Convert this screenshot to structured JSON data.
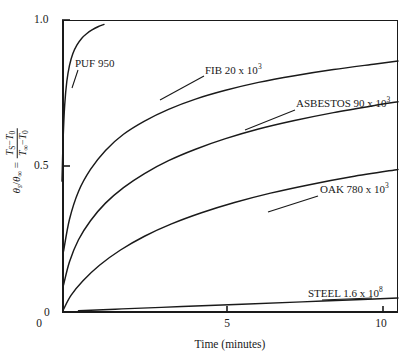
{
  "figure": {
    "title": "",
    "background_color": "#ffffff",
    "line_color": "#1a1a1a"
  },
  "axes": {
    "x": {
      "label": "Time (minutes)",
      "ticks": [
        "0",
        "5",
        "10"
      ],
      "tick_values": [
        0,
        5,
        10
      ],
      "min": 0,
      "max": 11.2
    },
    "y": {
      "label_parts": {
        "symbol": "θ",
        "symbol_sub_s": "s",
        "slash": "/",
        "symbol2": "θ",
        "symbol2_sub": "∞",
        "equals": "=",
        "num_left": "T",
        "num_left_sub": "S",
        "num_minus": "−",
        "num_right": "T",
        "num_right_sub": "0",
        "den_left": "T",
        "den_left_sub": "∞",
        "den_minus": "−",
        "den_right": "T",
        "den_right_sub": "0"
      },
      "ticks": [
        "1.0",
        "0.5",
        "0"
      ],
      "tick_values": [
        1.0,
        0.5,
        0.0
      ],
      "min": 0,
      "max": 1.0
    }
  },
  "chart_data": {
    "type": "line",
    "title": "",
    "xlabel": "Time (minutes)",
    "ylabel": "θs/θ∞ = (TS − T0)/(T∞ − T0)",
    "xlim": [
      0,
      11.2
    ],
    "ylim": [
      0,
      1.0
    ],
    "grid": false,
    "legend": "inline-curve-labels",
    "series": [
      {
        "name": "PUF 950",
        "label": "PUF 950",
        "label_value": "950",
        "x": [
          0.0,
          0.04,
          0.09,
          0.16,
          0.25,
          0.36,
          0.5,
          0.66,
          0.82,
          1.0,
          1.2,
          1.4
        ],
        "y": [
          0.45,
          0.6,
          0.71,
          0.79,
          0.845,
          0.885,
          0.915,
          0.938,
          0.953,
          0.966,
          0.977,
          0.985
        ]
      },
      {
        "name": "FIB 20 x 10^3",
        "label": "FIB 20 x 10",
        "label_exponent": "3",
        "x": [
          0.05,
          0.25,
          0.55,
          0.95,
          1.45,
          2.05,
          2.75,
          3.55,
          4.45,
          5.45,
          6.55,
          7.75,
          9.05,
          10.45,
          11.2
        ],
        "y": [
          0.21,
          0.32,
          0.415,
          0.49,
          0.555,
          0.61,
          0.655,
          0.695,
          0.73,
          0.76,
          0.787,
          0.81,
          0.831,
          0.85,
          0.86
        ]
      },
      {
        "name": "ASBESTOS 90 x 10^3",
        "label": "ASBESTOS 90 x 10",
        "label_exponent": "3",
        "x": [
          0.05,
          0.25,
          0.55,
          0.95,
          1.45,
          2.05,
          2.75,
          3.55,
          4.45,
          5.45,
          6.55,
          7.75,
          9.05,
          10.45,
          11.2
        ],
        "y": [
          0.095,
          0.175,
          0.25,
          0.315,
          0.375,
          0.428,
          0.476,
          0.52,
          0.559,
          0.595,
          0.628,
          0.657,
          0.684,
          0.709,
          0.721
        ]
      },
      {
        "name": "OAK 780 x 10^3",
        "label": "OAK 780 x 10",
        "label_exponent": "3",
        "x": [
          0.05,
          0.3,
          0.7,
          1.25,
          1.95,
          2.75,
          3.65,
          4.65,
          5.75,
          6.95,
          8.25,
          9.65,
          11.2
        ],
        "y": [
          0.012,
          0.06,
          0.11,
          0.163,
          0.215,
          0.262,
          0.304,
          0.342,
          0.377,
          0.409,
          0.438,
          0.465,
          0.49
        ]
      },
      {
        "name": "STEEL 1.6 x 10^8",
        "label": "STEEL 1.6 x 10",
        "label_exponent": "8",
        "x": [
          0.55,
          2.0,
          4.0,
          6.0,
          8.0,
          10.0,
          11.2
        ],
        "y": [
          0.008,
          0.014,
          0.022,
          0.03,
          0.038,
          0.046,
          0.051
        ]
      }
    ]
  },
  "curve_labels": [
    {
      "id": "puf",
      "text": "PUF 950",
      "exponent": ""
    },
    {
      "id": "fib",
      "text": "FIB 20 x 10",
      "exponent": "3"
    },
    {
      "id": "asbestos",
      "text": "ASBESTOS 90 x 10",
      "exponent": "3"
    },
    {
      "id": "oak",
      "text": "OAK 780 x 10",
      "exponent": "3"
    },
    {
      "id": "steel",
      "text": "STEEL 1.6 x 10",
      "exponent": "8"
    }
  ]
}
